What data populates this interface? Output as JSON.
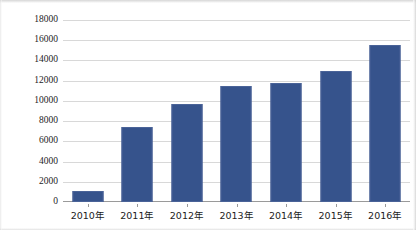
{
  "chart_data": {
    "type": "bar",
    "title": "",
    "subtitle": "",
    "xlabel": "",
    "ylabel": "年平均日交通量（辆/日）",
    "categories": [
      "2010年",
      "2011年",
      "2012年",
      "2013年",
      "2014年",
      "2015年",
      "2016年"
    ],
    "values": [
      1080,
      7400,
      9650,
      11500,
      11800,
      13000,
      15500
    ],
    "series": [
      {
        "name": "年平均日交通量",
        "values": [
          1080,
          7400,
          9650,
          11500,
          11800,
          13000,
          15500
        ]
      }
    ],
    "ylim": [
      0,
      18000
    ],
    "ytick_interval": 2000,
    "ytick_labels": [
      "0",
      "2000",
      "4000",
      "6000",
      "8000",
      "10000",
      "12000",
      "14000",
      "16000",
      "18000"
    ],
    "ytick_values": [
      0,
      2000,
      4000,
      6000,
      8000,
      10000,
      12000,
      14000,
      16000,
      18000
    ],
    "grid": true,
    "grid_axis": "y",
    "legend": false,
    "legend_position": "none",
    "bar_color": "#36538C",
    "bar_border_color": "#4A6398",
    "gridline_color": "#D8D8D8",
    "axis_color": "#9A9A9A",
    "background_color": "#FFFFFF",
    "annotations": []
  }
}
